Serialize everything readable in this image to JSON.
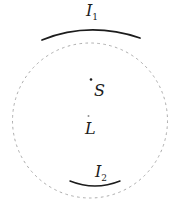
{
  "figure": {
    "labels": {
      "image1": {
        "main": "I",
        "sub": "1"
      },
      "image2": {
        "main": "I",
        "sub": "2"
      },
      "source": "S",
      "lens": "L"
    },
    "colors": {
      "background": "#ffffff",
      "ring": "#a3a3a3",
      "arc": "#1c1c1c",
      "text": "#1c1c1c",
      "dot": "#1c1c1c",
      "dot_faint": "#8f8f8f"
    },
    "geometry": {
      "canvas": {
        "width": 182,
        "height": 208
      },
      "ring": {
        "cx": 90,
        "cy": 120.5,
        "r": 77.5
      },
      "arc1": {
        "d": "M 42 40 Q 89 21 140 38"
      },
      "arc2": {
        "d": "M 70 181 Q 95 191 120 181"
      },
      "source_dot": {
        "cx": 91,
        "cy": 79.5,
        "r": 1.3
      },
      "lens_dot": {
        "cx": 88.5,
        "cy": 116,
        "r": 1
      },
      "label_i1": {
        "x": 86,
        "y": 16
      },
      "label_i2": {
        "x": 95,
        "y": 177
      },
      "label_s": {
        "x": 94,
        "y": 96
      },
      "label_l": {
        "x": 85,
        "y": 134
      }
    }
  }
}
